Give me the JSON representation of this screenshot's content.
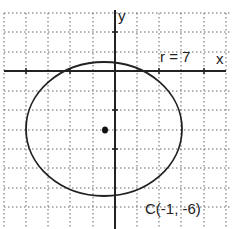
{
  "diagram": {
    "type": "circle-on-coordinate-grid",
    "axes": {
      "x_label": "x",
      "y_label": "y"
    },
    "radius_label": "r = 7",
    "center_label": "C(-1, -6)",
    "center": {
      "x": -1,
      "y": -6
    },
    "radius": 7,
    "grid": {
      "style": "dotted"
    },
    "colors": {
      "stroke": "#222222",
      "grid": "#555555",
      "background": "#ffffff"
    }
  }
}
